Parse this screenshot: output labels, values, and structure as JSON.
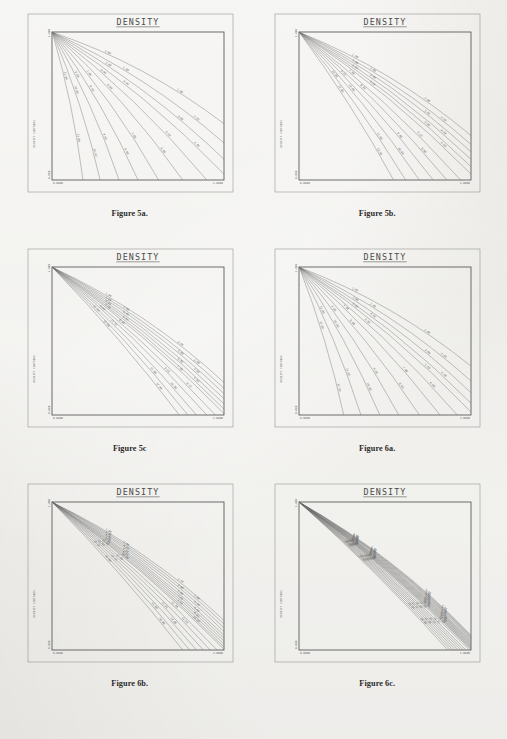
{
  "page": {
    "background_color": "#e8e7e3",
    "ink_color": "#4a4a4a",
    "columns": 2,
    "rows": 3
  },
  "figures": [
    {
      "caption": "Figure 5a.",
      "chart_data": {
        "type": "line",
        "title": "DENSITY",
        "xlabel": "",
        "ylabel": "",
        "xlim": [
          0.0,
          1.0
        ],
        "ylim": [
          0.0,
          1.0
        ],
        "x_tick_labels": [
          "0.0000",
          "1.0000"
        ],
        "y_tick_labels": [
          "0.000",
          "1.000"
        ],
        "grid": false,
        "legend": "none",
        "axis_text_vertical": "DENSITY CONTOURS",
        "fan_spread": 0.95,
        "n_contours": 11,
        "contour_levels": [
          "1.00",
          "2.00",
          "3.00",
          "4.00",
          "5.00",
          "6.00",
          "7.00",
          "8.00",
          "9.00",
          "10.00",
          "11.00"
        ],
        "series": [
          {
            "name": "1.00",
            "end_x": 1.0,
            "end_y": 0.38
          },
          {
            "name": "2.00",
            "end_x": 1.0,
            "end_y": 0.25
          },
          {
            "name": "3.00",
            "end_x": 1.0,
            "end_y": 0.14
          },
          {
            "name": "4.00",
            "end_x": 1.0,
            "end_y": 0.04
          },
          {
            "name": "5.00",
            "end_x": 0.9,
            "end_y": 0.0
          },
          {
            "name": "6.00",
            "end_x": 0.76,
            "end_y": 0.0
          },
          {
            "name": "7.00",
            "end_x": 0.62,
            "end_y": 0.0
          },
          {
            "name": "8.00",
            "end_x": 0.5,
            "end_y": 0.0
          },
          {
            "name": "9.00",
            "end_x": 0.39,
            "end_y": 0.0
          },
          {
            "name": "10.00",
            "end_x": 0.28,
            "end_y": 0.0
          },
          {
            "name": "11.00",
            "end_x": 0.18,
            "end_y": 0.0
          }
        ]
      }
    },
    {
      "caption": "Figure 5b.",
      "chart_data": {
        "type": "line",
        "title": "DENSITY",
        "xlabel": "",
        "ylabel": "",
        "xlim": [
          0.0,
          1.0
        ],
        "ylim": [
          0.0,
          1.0
        ],
        "x_tick_labels": [
          "0.0000",
          "1.0000"
        ],
        "y_tick_labels": [
          "0.000",
          "1.000"
        ],
        "grid": false,
        "legend": "none",
        "axis_text_vertical": "DENSITY CONTOURS",
        "fan_spread": 0.55,
        "n_contours": 12,
        "contour_levels": [
          "1.00",
          "2.00",
          "3.00",
          "4.00",
          "5.00",
          "6.00",
          "7.00",
          "8.00",
          "9.00",
          "10.00",
          "11.00",
          "12.00"
        ],
        "series": [
          {
            "name": "1.00",
            "end_x": 1.0,
            "end_y": 0.3
          },
          {
            "name": "2.00",
            "end_x": 1.0,
            "end_y": 0.24
          },
          {
            "name": "3.00",
            "end_x": 1.0,
            "end_y": 0.19
          },
          {
            "name": "4.00",
            "end_x": 1.0,
            "end_y": 0.14
          },
          {
            "name": "5.00",
            "end_x": 1.0,
            "end_y": 0.09
          },
          {
            "name": "6.00",
            "end_x": 1.0,
            "end_y": 0.04
          },
          {
            "name": "7.00",
            "end_x": 0.94,
            "end_y": 0.0
          },
          {
            "name": "8.00",
            "end_x": 0.86,
            "end_y": 0.0
          },
          {
            "name": "9.00",
            "end_x": 0.78,
            "end_y": 0.0
          },
          {
            "name": "10.00",
            "end_x": 0.7,
            "end_y": 0.0
          },
          {
            "name": "11.00",
            "end_x": 0.62,
            "end_y": 0.0
          },
          {
            "name": "12.00",
            "end_x": 0.55,
            "end_y": 0.0
          }
        ]
      }
    },
    {
      "caption": "Figure 5c",
      "chart_data": {
        "type": "line",
        "title": "DENSITY",
        "xlabel": "",
        "ylabel": "",
        "xlim": [
          0.0,
          1.0
        ],
        "ylim": [
          0.0,
          1.0
        ],
        "x_tick_labels": [
          "0.0000",
          "1.0000"
        ],
        "y_tick_labels": [
          "0.000",
          "1.000"
        ],
        "grid": false,
        "legend": "none",
        "axis_text_vertical": "DENSITY CONTOURS",
        "fan_spread": 0.4,
        "n_contours": 12,
        "contour_levels": [
          "1.00",
          "2.00",
          "3.00",
          "4.00",
          "5.00",
          "6.00",
          "7.00",
          "8.00",
          "9.00",
          "10.00",
          "11.00",
          "12.00"
        ],
        "series": [
          {
            "name": "1.00",
            "end_x": 1.0,
            "end_y": 0.22
          },
          {
            "name": "2.00",
            "end_x": 1.0,
            "end_y": 0.18
          },
          {
            "name": "3.00",
            "end_x": 1.0,
            "end_y": 0.145
          },
          {
            "name": "4.00",
            "end_x": 1.0,
            "end_y": 0.11
          },
          {
            "name": "5.00",
            "end_x": 1.0,
            "end_y": 0.075
          },
          {
            "name": "6.00",
            "end_x": 1.0,
            "end_y": 0.04
          },
          {
            "name": "7.00",
            "end_x": 1.0,
            "end_y": 0.01
          },
          {
            "name": "8.00",
            "end_x": 0.95,
            "end_y": 0.0
          },
          {
            "name": "9.00",
            "end_x": 0.9,
            "end_y": 0.0
          },
          {
            "name": "10.00",
            "end_x": 0.84,
            "end_y": 0.0
          },
          {
            "name": "11.00",
            "end_x": 0.79,
            "end_y": 0.0
          },
          {
            "name": "12.00",
            "end_x": 0.74,
            "end_y": 0.0
          }
        ]
      }
    },
    {
      "caption": "Figure 6a.",
      "chart_data": {
        "type": "line",
        "title": "DENSITY",
        "xlabel": "",
        "ylabel": "",
        "xlim": [
          0.0,
          1.0
        ],
        "ylim": [
          0.0,
          1.0
        ],
        "x_tick_labels": [
          "0.0000",
          "1.0000"
        ],
        "y_tick_labels": [
          "0.000",
          "1.000"
        ],
        "grid": false,
        "legend": "none",
        "axis_text_vertical": "DENSITY CONTOURS",
        "fan_spread": 0.9,
        "n_contours": 12,
        "contour_levels": [
          "1.00",
          "2.00",
          "3.00",
          "4.00",
          "5.00",
          "6.00",
          "7.00",
          "8.00",
          "9.00",
          "10.00",
          "11.00",
          "12.00"
        ],
        "series": [
          {
            "name": "1.00",
            "end_x": 1.0,
            "end_y": 0.33
          },
          {
            "name": "2.00",
            "end_x": 1.0,
            "end_y": 0.23
          },
          {
            "name": "3.00",
            "end_x": 1.0,
            "end_y": 0.15
          },
          {
            "name": "4.00",
            "end_x": 1.0,
            "end_y": 0.08
          },
          {
            "name": "5.00",
            "end_x": 1.0,
            "end_y": 0.02
          },
          {
            "name": "6.00",
            "end_x": 0.92,
            "end_y": 0.0
          },
          {
            "name": "7.00",
            "end_x": 0.82,
            "end_y": 0.0
          },
          {
            "name": "8.00",
            "end_x": 0.7,
            "end_y": 0.0
          },
          {
            "name": "9.00",
            "end_x": 0.58,
            "end_y": 0.0
          },
          {
            "name": "10.00",
            "end_x": 0.47,
            "end_y": 0.0
          },
          {
            "name": "11.00",
            "end_x": 0.36,
            "end_y": 0.0
          },
          {
            "name": "12.00",
            "end_x": 0.26,
            "end_y": 0.0
          }
        ]
      }
    },
    {
      "caption": "Figure 6b.",
      "chart_data": {
        "type": "line",
        "title": "DENSITY",
        "xlabel": "",
        "ylabel": "",
        "xlim": [
          0.0,
          1.0
        ],
        "ylim": [
          0.0,
          1.0
        ],
        "x_tick_labels": [
          "0.0000",
          "1.0000"
        ],
        "y_tick_labels": [
          "0.000",
          "1.000"
        ],
        "grid": false,
        "legend": "none",
        "axis_text_vertical": "DENSITY CONTOURS",
        "fan_spread": 0.35,
        "n_contours": 16,
        "contour_levels": [
          "1.00",
          "2.00",
          "3.00",
          "4.00",
          "5.00",
          "6.00",
          "7.00",
          "8.00",
          "9.00",
          "10.00",
          "11.00",
          "12.00",
          "13.00",
          "14.00",
          "15.00",
          "16.00"
        ],
        "series": [
          {
            "name": "1.00",
            "end_x": 1.0,
            "end_y": 0.2
          },
          {
            "name": "2.00",
            "end_x": 1.0,
            "end_y": 0.175
          },
          {
            "name": "3.00",
            "end_x": 1.0,
            "end_y": 0.15
          },
          {
            "name": "4.00",
            "end_x": 1.0,
            "end_y": 0.125
          },
          {
            "name": "5.00",
            "end_x": 1.0,
            "end_y": 0.1
          },
          {
            "name": "6.00",
            "end_x": 1.0,
            "end_y": 0.08
          },
          {
            "name": "7.00",
            "end_x": 1.0,
            "end_y": 0.06
          },
          {
            "name": "8.00",
            "end_x": 1.0,
            "end_y": 0.04
          },
          {
            "name": "9.00",
            "end_x": 1.0,
            "end_y": 0.02
          },
          {
            "name": "10.00",
            "end_x": 1.0,
            "end_y": 0.005
          },
          {
            "name": "11.00",
            "end_x": 0.96,
            "end_y": 0.0
          },
          {
            "name": "12.00",
            "end_x": 0.92,
            "end_y": 0.0
          },
          {
            "name": "13.00",
            "end_x": 0.88,
            "end_y": 0.0
          },
          {
            "name": "14.00",
            "end_x": 0.84,
            "end_y": 0.0
          },
          {
            "name": "15.00",
            "end_x": 0.8,
            "end_y": 0.0
          },
          {
            "name": "16.00",
            "end_x": 0.76,
            "end_y": 0.0
          }
        ]
      }
    },
    {
      "caption": "Figure 6c.",
      "chart_data": {
        "type": "line",
        "title": "DENSITY",
        "xlabel": "",
        "ylabel": "",
        "xlim": [
          0.0,
          1.0
        ],
        "ylim": [
          0.0,
          1.0
        ],
        "x_tick_labels": [
          "0.0000",
          "1.0000"
        ],
        "y_tick_labels": [
          "0.000",
          "1.000"
        ],
        "grid": false,
        "legend": "none",
        "axis_text_vertical": "DENSITY CONTOURS",
        "fan_spread": 0.14,
        "n_contours": 24,
        "contour_levels": [
          "1.00",
          "2.00",
          "3.00",
          "4.00",
          "5.00",
          "6.00",
          "7.00",
          "8.00",
          "9.00",
          "10.00",
          "11.00",
          "12.00",
          "13.00",
          "14.00",
          "15.00",
          "16.00",
          "17.00",
          "18.00",
          "19.00",
          "20.00",
          "21.00",
          "22.00",
          "23.00",
          "24.00"
        ],
        "series": [
          {
            "name": "1.00",
            "end_x": 1.0,
            "end_y": 0.1
          },
          {
            "name": "2.00",
            "end_x": 1.0,
            "end_y": 0.093
          },
          {
            "name": "3.00",
            "end_x": 1.0,
            "end_y": 0.086
          },
          {
            "name": "4.00",
            "end_x": 1.0,
            "end_y": 0.079
          },
          {
            "name": "5.00",
            "end_x": 1.0,
            "end_y": 0.072
          },
          {
            "name": "6.00",
            "end_x": 1.0,
            "end_y": 0.065
          },
          {
            "name": "7.00",
            "end_x": 1.0,
            "end_y": 0.058
          },
          {
            "name": "8.00",
            "end_x": 1.0,
            "end_y": 0.051
          },
          {
            "name": "9.00",
            "end_x": 1.0,
            "end_y": 0.044
          },
          {
            "name": "10.00",
            "end_x": 1.0,
            "end_y": 0.037
          },
          {
            "name": "11.00",
            "end_x": 1.0,
            "end_y": 0.03
          },
          {
            "name": "12.00",
            "end_x": 1.0,
            "end_y": 0.023
          },
          {
            "name": "13.00",
            "end_x": 1.0,
            "end_y": 0.016
          },
          {
            "name": "14.00",
            "end_x": 1.0,
            "end_y": 0.009
          },
          {
            "name": "15.00",
            "end_x": 1.0,
            "end_y": 0.002
          },
          {
            "name": "16.00",
            "end_x": 0.99,
            "end_y": 0.0
          },
          {
            "name": "17.00",
            "end_x": 0.97,
            "end_y": 0.0
          },
          {
            "name": "18.00",
            "end_x": 0.955,
            "end_y": 0.0
          },
          {
            "name": "19.00",
            "end_x": 0.94,
            "end_y": 0.0
          },
          {
            "name": "20.00",
            "end_x": 0.925,
            "end_y": 0.0
          },
          {
            "name": "21.00",
            "end_x": 0.91,
            "end_y": 0.0
          },
          {
            "name": "22.00",
            "end_x": 0.895,
            "end_y": 0.0
          },
          {
            "name": "23.00",
            "end_x": 0.88,
            "end_y": 0.0
          },
          {
            "name": "24.00",
            "end_x": 0.865,
            "end_y": 0.0
          }
        ]
      }
    }
  ]
}
